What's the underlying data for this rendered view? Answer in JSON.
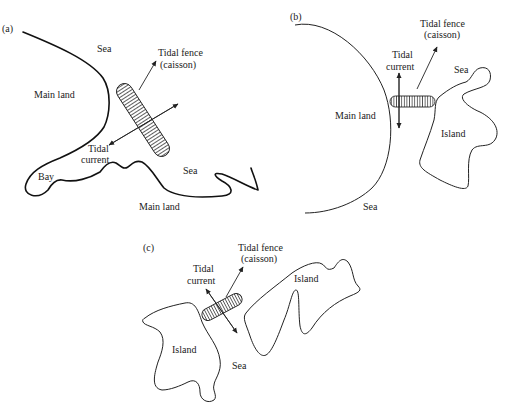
{
  "figure": {
    "panels": [
      {
        "id": "a",
        "tag": "(a)",
        "labels": {
          "sea_top": "Sea",
          "main_land_left": "Main land",
          "fence_line1": "Tidal fence",
          "fence_line2": "(caisson)",
          "current_line1": "Tidal",
          "current_line2": "current",
          "bay": "Bay",
          "sea_right": "Sea",
          "main_land_bottom": "Main land"
        }
      },
      {
        "id": "b",
        "tag": "(b)",
        "labels": {
          "fence_line1": "Tidal fence",
          "fence_line2": "(caisson)",
          "current_line1": "Tidal",
          "current_line2": "current",
          "sea_top": "Sea",
          "main_land": "Main land",
          "island": "Island",
          "sea_bottom": "Sea"
        }
      },
      {
        "id": "c",
        "tag": "(c)",
        "labels": {
          "fence_line1": "Tidal fence",
          "fence_line2": "(caisson)",
          "current_line1": "Tidal",
          "current_line2": "current",
          "island_right": "Island",
          "island_left": "Island",
          "sea": "Sea"
        }
      }
    ]
  }
}
